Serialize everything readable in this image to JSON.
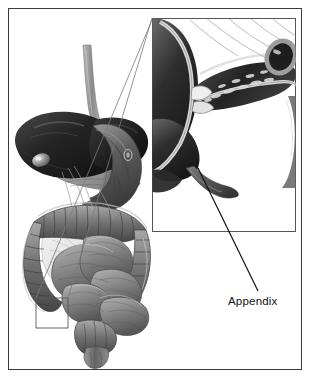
{
  "figure": {
    "kind": "medical-illustration",
    "background_color": "#ffffff",
    "frame_color": "#3a3a3a",
    "ink_color": "#111111"
  },
  "labels": {
    "appendix": "Appendix"
  },
  "inset": {
    "border_color": "#555555",
    "background_color": "#ffffff",
    "description": "Cut-away cross-section of the cecum, terminal ileum and ileocecal valve with the vermiform appendix"
  },
  "anatomy": {
    "organs": [
      {
        "name": "liver",
        "tone": "#2b2b2b"
      },
      {
        "name": "gallbladder",
        "tone": "#6e6e6e"
      },
      {
        "name": "stomach",
        "tone": "#585858"
      },
      {
        "name": "pancreas",
        "tone": "#8a8a8a"
      },
      {
        "name": "duodenum",
        "tone": "#707070"
      },
      {
        "name": "transverse-colon",
        "tone": "#6a6a6a"
      },
      {
        "name": "ascending-colon",
        "tone": "#6a6a6a"
      },
      {
        "name": "descending-colon",
        "tone": "#6a6a6a"
      },
      {
        "name": "sigmoid-colon",
        "tone": "#6a6a6a"
      },
      {
        "name": "small-intestine",
        "tone": "#7d7d7d"
      },
      {
        "name": "mesentery",
        "tone": "#d8d8d8"
      },
      {
        "name": "cecum",
        "tone": "#5e5e5e"
      },
      {
        "name": "appendix",
        "tone": "#4f4f4f"
      },
      {
        "name": "rectum",
        "tone": "#707070"
      },
      {
        "name": "esophagus",
        "tone": "#8f8f8f"
      }
    ]
  },
  "callout": {
    "source_box": {
      "x": 36,
      "y": 298,
      "width": 32,
      "height": 30
    },
    "leader_from": {
      "x": 198,
      "y": 168
    },
    "leader_to": {
      "x": 258,
      "y": 291
    }
  }
}
